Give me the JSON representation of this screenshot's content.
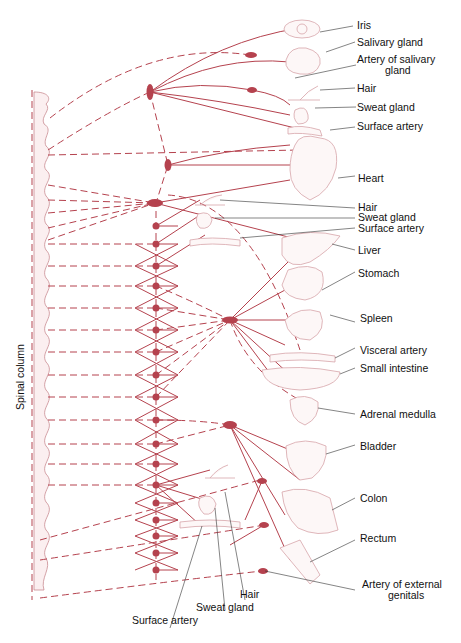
{
  "diagram": {
    "axis_label": "Spinal column",
    "colors": {
      "nerve": "#b5424e",
      "organ_outline": "#d7a4aa",
      "text": "#111111"
    },
    "labels": {
      "iris": "Iris",
      "salivary_gland": "Salivary gland",
      "artery_salivary_1": "Artery of salivary",
      "artery_salivary_2": "gland",
      "hair_top": "Hair",
      "sweat_gland_top": "Sweat gland",
      "surface_artery_top": "Surface artery",
      "heart": "Heart",
      "hair_mid": "Hair",
      "sweat_gland_mid": "Sweat gland",
      "surface_artery_mid": "Surface artery",
      "liver": "Liver",
      "stomach": "Stomach",
      "spleen": "Spleen",
      "visceral_artery": "Visceral artery",
      "small_intestine": "Small intestine",
      "adrenal_medulla": "Adrenal medulla",
      "bladder": "Bladder",
      "colon": "Colon",
      "rectum": "Rectum",
      "artery_genitals_1": "Artery of external",
      "artery_genitals_2": "genitals",
      "hair_bottom": "Hair",
      "sweat_gland_bottom": "Sweat gland",
      "surface_artery_bottom": "Surface artery"
    }
  }
}
